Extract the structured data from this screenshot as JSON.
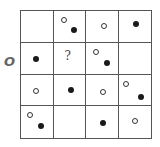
{
  "puzzle": {
    "side_label": "O",
    "question_mark": "?",
    "grid": {
      "rows": 4,
      "cols": 4,
      "cells": [
        [
          {
            "dots": []
          },
          {
            "dots": [
              {
                "type": "open",
                "x": 7,
                "y": 6
              },
              {
                "type": "filled",
                "x": 17,
                "y": 16
              }
            ]
          },
          {
            "dots": [
              {
                "type": "open",
                "x": 15,
                "y": 12
              }
            ]
          },
          {
            "dots": [
              {
                "type": "filled",
                "x": 14,
                "y": 10
              }
            ]
          }
        ],
        [
          {
            "dots": [
              {
                "type": "filled",
                "x": 12,
                "y": 13
              }
            ]
          },
          {
            "dots": [],
            "question": true
          },
          {
            "dots": [
              {
                "type": "open",
                "x": 7,
                "y": 6
              },
              {
                "type": "filled",
                "x": 18,
                "y": 17
              }
            ]
          },
          {
            "dots": []
          }
        ],
        [
          {
            "dots": [
              {
                "type": "open",
                "x": 12,
                "y": 13
              }
            ]
          },
          {
            "dots": [
              {
                "type": "filled",
                "x": 14,
                "y": 12
              }
            ]
          },
          {
            "dots": [
              {
                "type": "open",
                "x": 14,
                "y": 14
              }
            ]
          },
          {
            "dots": [
              {
                "type": "open",
                "x": 4,
                "y": 6
              },
              {
                "type": "filled",
                "x": 19,
                "y": 19
              }
            ]
          }
        ],
        [
          {
            "dots": [
              {
                "type": "open",
                "x": 6,
                "y": 6
              },
              {
                "type": "filled",
                "x": 17,
                "y": 17
              }
            ]
          },
          {
            "dots": []
          },
          {
            "dots": [
              {
                "type": "filled",
                "x": 14,
                "y": 14
              }
            ]
          },
          {
            "dots": [
              {
                "type": "open",
                "x": 13,
                "y": 12
              }
            ]
          }
        ]
      ]
    }
  }
}
